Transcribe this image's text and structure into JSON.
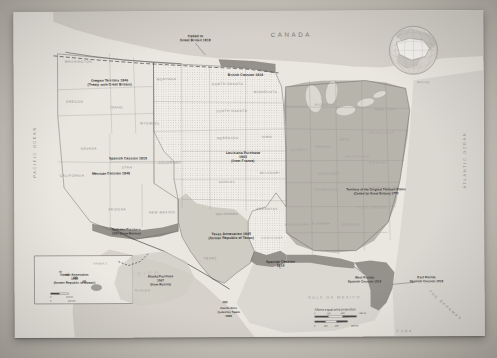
{
  "map": {
    "title": "Territorial Acquisitions of the United States",
    "projection_note": "Albers equal area projection",
    "countries": {
      "canada": "CANADA",
      "mexico": "MEXICO",
      "bahamas": "THE BAHAMAS",
      "cuba": "CUBA"
    },
    "oceans": {
      "pacific": "PACIFIC OCEAN",
      "atlantic": "ATLANTIC OCEAN",
      "gulf": "GULF OF MEXICO"
    },
    "acquisitions": [
      {
        "id": "ceded-great-britain-1818",
        "label": "Ceded to\nGreat Britain 1818",
        "lines": [
          "Ceded to",
          "Great Britain 1818"
        ],
        "x": 182,
        "y": 26
      },
      {
        "id": "british-cession-1818",
        "label": "British Cession 1818",
        "lines": [
          "British Cession 1818"
        ],
        "x": 230,
        "y": 63
      },
      {
        "id": "oregon-territory-1846",
        "label": "Oregon Territory 1846 (Treaty with Great Britain)",
        "lines": [
          "Oregon Territory 1846",
          "(Treaty with Great Britain)"
        ],
        "x": 96,
        "y": 71
      },
      {
        "id": "louisiana-purchase-1803",
        "label": "Louisiana Purchase 1803 (from France)",
        "lines": [
          "Louisiana Purchase",
          "1803",
          "from France)"
        ],
        "x": 229,
        "y": 145
      },
      {
        "id": "spanish-cession-1819-utah",
        "label": "Spanish Cession 1819",
        "lines": [
          "Spanish Cession 1819"
        ],
        "x": 114,
        "y": 148
      },
      {
        "id": "mexican-cession-1848",
        "label": "Mexican Cession 1848",
        "lines": [
          "Mexican Cession 1848"
        ],
        "x": 97,
        "y": 161
      },
      {
        "id": "gadsden-purchase-1853",
        "label": "Gadsden Purchase 1853 (from Mexico)",
        "lines": [
          "Gadsden Purchase",
          "1853 (from Mexico)"
        ],
        "x": 112,
        "y": 221
      },
      {
        "id": "texas-annexation-1845",
        "label": "Texas Annexation 1845 (former Republic of Texas)",
        "lines": [
          "Texas Annexation 1845",
          "(former Republic of Texas)"
        ],
        "x": 217,
        "y": 226
      },
      {
        "id": "spanish-cession-1819-south",
        "label": "Spanish Cession 1819",
        "lines": [
          "Spanish Cession",
          "1819"
        ],
        "x": 266,
        "y": 254
      },
      {
        "id": "original-thirteen-states-1783",
        "label": "Territory of the Original Thirteen States (Ceded by Great Britain) 1783",
        "lines": [
          "Territory of the Original Thirteen States",
          "(Ceded by Great Britain) 1783"
        ],
        "x": 362,
        "y": 182
      },
      {
        "id": "west-florida-1819",
        "label": "West Florida Spanish Cession 1819",
        "lines": [
          "West Florida",
          "Spanish Cession 1819"
        ],
        "x": 350,
        "y": 270
      },
      {
        "id": "east-florida-1819",
        "label": "East Florida Spanish Cession 1819",
        "lines": [
          "East Florida",
          "Spanish Cession 1819"
        ],
        "x": 408,
        "y": 270
      },
      {
        "id": "hawaii-annexation-1898",
        "label": "Hawaii Annexation 1898 (former Republic of Hawaii)",
        "lines": [
          "Hawaii Annexation",
          "1898",
          "(former Republic of Hawaii)"
        ],
        "x": 61,
        "y": 265
      },
      {
        "id": "alaska-purchase-1867",
        "label": "Alaska Purchase 1867 (from Russia)",
        "lines": [
          "Alaska Purchase",
          "1867",
          "(from Russia)"
        ],
        "x": 118,
        "y": 268
      },
      {
        "id": "puerto-rico-1898",
        "label": "Puerto Rico Ceded by Spain 1898",
        "lines": [
          "Puerto Rico",
          "Ceded by Spain",
          "1898"
        ],
        "x": 214,
        "y": 299
      }
    ],
    "inset_labels": {
      "hawaii": "HAWAII",
      "alaska": "ALASKA"
    },
    "states": [
      {
        "name": "WASHINGTON",
        "x": 65,
        "y": 51
      },
      {
        "name": "OREGON",
        "x": 61,
        "y": 91
      },
      {
        "name": "IDAHO",
        "x": 103,
        "y": 97
      },
      {
        "name": "MONTANA",
        "x": 153,
        "y": 69
      },
      {
        "name": "NORTH DAKOTA",
        "x": 214,
        "y": 74
      },
      {
        "name": "SOUTH DAKOTA",
        "x": 218,
        "y": 101
      },
      {
        "name": "WYOMING",
        "x": 136,
        "y": 113
      },
      {
        "name": "NEVADA",
        "x": 75,
        "y": 138
      },
      {
        "name": "UTAH",
        "x": 113,
        "y": 155
      },
      {
        "name": "COLORADO",
        "x": 156,
        "y": 152
      },
      {
        "name": "NEBRASKA",
        "x": 214,
        "y": 128
      },
      {
        "name": "IOWA",
        "x": 253,
        "y": 127
      },
      {
        "name": "KANSAS",
        "x": 213,
        "y": 172
      },
      {
        "name": "MISSOURI",
        "x": 256,
        "y": 163
      },
      {
        "name": "OKLAHOMA",
        "x": 213,
        "y": 204
      },
      {
        "name": "ARKANSAS",
        "x": 253,
        "y": 199
      },
      {
        "name": "CALIFORNIA",
        "x": 58,
        "y": 165
      },
      {
        "name": "ARIZONA",
        "x": 103,
        "y": 199
      },
      {
        "name": "NEW MEXICO",
        "x": 148,
        "y": 202
      },
      {
        "name": "TEXAS",
        "x": 196,
        "y": 248
      },
      {
        "name": "MINNESOTA",
        "x": 252,
        "y": 82
      },
      {
        "name": "WISCONSIN",
        "x": 283,
        "y": 97
      },
      {
        "name": "MICHIGAN",
        "x": 311,
        "y": 95
      },
      {
        "name": "ILLINOIS",
        "x": 285,
        "y": 140
      },
      {
        "name": "INDIANA",
        "x": 309,
        "y": 137
      },
      {
        "name": "OHIO",
        "x": 331,
        "y": 130
      },
      {
        "name": "KENTUCKY",
        "x": 315,
        "y": 164
      },
      {
        "name": "TENNESSEE",
        "x": 312,
        "y": 180
      },
      {
        "name": "MISSISSIPPI",
        "x": 283,
        "y": 215
      },
      {
        "name": "ALABAMA",
        "x": 307,
        "y": 214
      },
      {
        "name": "GEORGIA",
        "x": 337,
        "y": 215
      },
      {
        "name": "FLORIDA",
        "x": 366,
        "y": 256
      },
      {
        "name": "LOUISIANA",
        "x": 258,
        "y": 228
      },
      {
        "name": "SOUTH CAROLINA",
        "x": 356,
        "y": 196
      },
      {
        "name": "NORTH CAROLINA",
        "x": 367,
        "y": 177
      },
      {
        "name": "VIRGINIA",
        "x": 363,
        "y": 153
      },
      {
        "name": "WEST VIRGINIA",
        "x": 344,
        "y": 147
      },
      {
        "name": "PENNSYLVANIA",
        "x": 366,
        "y": 123
      },
      {
        "name": "NEW YORK",
        "x": 369,
        "y": 100
      },
      {
        "name": "MAINE",
        "x": 408,
        "y": 73
      }
    ],
    "scale_bar": {
      "projection": "Albers equal area projection",
      "miles_ticks": [
        "0",
        "100",
        "200",
        "300 mi"
      ],
      "km_ticks": [
        "0",
        "100",
        "200",
        "300 km"
      ]
    }
  }
}
